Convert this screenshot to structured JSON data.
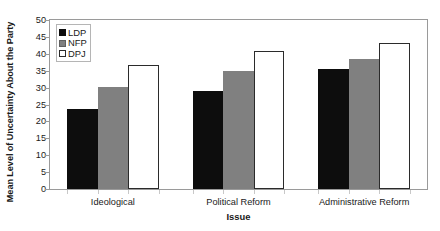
{
  "chart_data": {
    "type": "bar",
    "title": "",
    "subtitle": "",
    "xlabel": "Issue",
    "ylabel": "Mean Level of Uncertainty About the Party",
    "categories": [
      "Ideological",
      "Political Reform",
      "Administrative Reform"
    ],
    "series": [
      {
        "name": "LDP",
        "values": [
          23.7,
          29.0,
          35.4
        ],
        "color": "#0d0d0d"
      },
      {
        "name": "NFP",
        "values": [
          30.3,
          35.0,
          38.4
        ],
        "color": "#808080"
      },
      {
        "name": "DPJ",
        "values": [
          36.7,
          40.9,
          43.2
        ],
        "color": "#ffffff"
      }
    ],
    "ylim": [
      0,
      50
    ],
    "ytick_values": [
      0,
      5,
      10,
      15,
      20,
      25,
      30,
      35,
      40,
      45,
      50
    ],
    "ytick_labels": [
      "0",
      "5",
      "10",
      "15",
      "20",
      "25",
      "30",
      "35",
      "40",
      "45",
      "50"
    ],
    "grid": false,
    "legend_position": "upper left",
    "legend_entries": [
      "LDP",
      "NFP",
      "DPJ"
    ],
    "frame": true,
    "bar_border_color": "#2b2b2b",
    "frame_color": "#9a9a9a"
  }
}
